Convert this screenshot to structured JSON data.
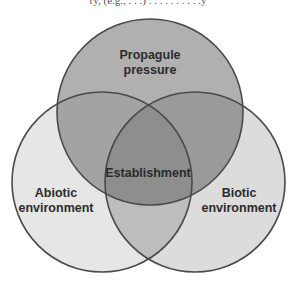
{
  "diagram": {
    "type": "venn",
    "cut_off_top_text": "ry, (e.g., . . .) . . . . . . . . . .y",
    "sets": [
      {
        "id": "propagule",
        "label_lines": [
          "Propagule",
          "pressure"
        ],
        "fill": "#b0b0b0"
      },
      {
        "id": "abiotic",
        "label_lines": [
          "Abiotic",
          "environment"
        ],
        "fill": "#e6e6e6"
      },
      {
        "id": "biotic",
        "label_lines": [
          "Biotic",
          "environment"
        ],
        "fill": "#dcdcdc"
      }
    ],
    "center_label": "Establishment",
    "colors": {
      "outline": "#4a4a4a",
      "pair_top_left": "#a3a3a3",
      "pair_top_right": "#9a9a9a",
      "pair_bottom": "#bdbdbd",
      "center": "#8e8e8e"
    }
  }
}
